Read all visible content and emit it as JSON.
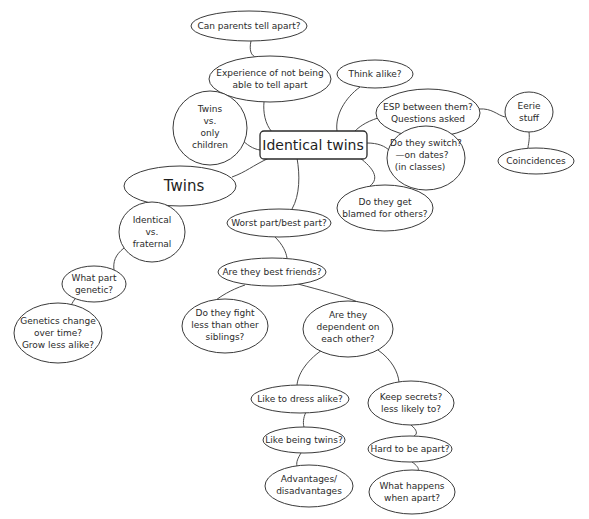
{
  "diagram": {
    "title": "Identical twins",
    "type": "mind-map",
    "root": {
      "id": "identical_twins",
      "label": "Identical twins"
    },
    "nodes": {
      "can_parents": {
        "lines": [
          "Can parents tell apart?"
        ]
      },
      "experience": {
        "lines": [
          "Experience of not being",
          "able to tell apart"
        ]
      },
      "think_alike": {
        "lines": [
          "Think alike?"
        ]
      },
      "twins_vs_only": {
        "lines": [
          "Twins",
          "vs.",
          "only",
          "children"
        ]
      },
      "esp": {
        "lines": [
          "ESP between them?",
          "Questions asked"
        ]
      },
      "eerie": {
        "lines": [
          "Eerie",
          "stuff"
        ]
      },
      "coincidences": {
        "lines": [
          "Coincidences"
        ]
      },
      "switch": {
        "lines": [
          "Do they switch?",
          "—on dates?",
          "(in classes)"
        ]
      },
      "blamed": {
        "lines": [
          "Do they get",
          "blamed for others?"
        ]
      },
      "twins": {
        "lines": [
          "Twins"
        ]
      },
      "worst_best": {
        "lines": [
          "Worst part/best part?"
        ]
      },
      "identical_vs_fraternal": {
        "lines": [
          "Identical",
          "vs.",
          "fraternal"
        ]
      },
      "best_friends": {
        "lines": [
          "Are they best friends?"
        ]
      },
      "what_part_genetic": {
        "lines": [
          "What part",
          "genetic?"
        ]
      },
      "fight": {
        "lines": [
          "Do they fight",
          "less than other",
          "siblings?"
        ]
      },
      "dependent": {
        "lines": [
          "Are they",
          "dependent on",
          "each other?"
        ]
      },
      "genetics_change": {
        "lines": [
          "Genetics change",
          "over time?",
          "Grow less alike?"
        ]
      },
      "dress_alike": {
        "lines": [
          "Like to dress alike?"
        ]
      },
      "secrets": {
        "lines": [
          "Keep secrets?",
          "less likely to?"
        ]
      },
      "like_being": {
        "lines": [
          "Like being twins?"
        ]
      },
      "hard_apart": {
        "lines": [
          "Hard to be apart?"
        ]
      },
      "advantages": {
        "lines": [
          "Advantages/",
          "disadvantages"
        ]
      },
      "what_happens": {
        "lines": [
          "What happens",
          "when apart?"
        ]
      }
    },
    "edges": [
      [
        "can_parents",
        "experience"
      ],
      [
        "experience",
        "identical_twins"
      ],
      [
        "think_alike",
        "identical_twins"
      ],
      [
        "twins_vs_only",
        "identical_twins"
      ],
      [
        "esp",
        "identical_twins"
      ],
      [
        "esp",
        "eerie"
      ],
      [
        "eerie",
        "coincidences"
      ],
      [
        "switch",
        "identical_twins"
      ],
      [
        "blamed",
        "identical_twins"
      ],
      [
        "twins",
        "identical_twins"
      ],
      [
        "worst_best",
        "identical_twins"
      ],
      [
        "twins",
        "identical_vs_fraternal"
      ],
      [
        "worst_best",
        "best_friends"
      ],
      [
        "identical_vs_fraternal",
        "what_part_genetic"
      ],
      [
        "best_friends",
        "fight"
      ],
      [
        "best_friends",
        "dependent"
      ],
      [
        "what_part_genetic",
        "genetics_change"
      ],
      [
        "dependent",
        "dress_alike"
      ],
      [
        "dependent",
        "secrets"
      ],
      [
        "dress_alike",
        "like_being"
      ],
      [
        "like_being",
        "advantages"
      ],
      [
        "secrets",
        "hard_apart"
      ],
      [
        "hard_apart",
        "what_happens"
      ]
    ],
    "colors": {
      "background": "#ffffff",
      "stroke": "#3a3a3a",
      "text": "#2b2b2b"
    }
  }
}
